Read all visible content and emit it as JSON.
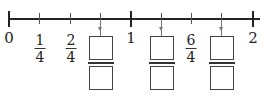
{
  "number_line": {
    "start": 0,
    "end": 2,
    "step": "1/4",
    "whole_labels": [
      "0",
      "1",
      "2"
    ],
    "given_fractions": [
      {
        "position": "1/4",
        "numerator": "1",
        "denominator": "4"
      },
      {
        "position": "2/4",
        "numerator": "2",
        "denominator": "4"
      },
      {
        "position": "6/4",
        "numerator": "6",
        "denominator": "4"
      }
    ],
    "blank_fractions": [
      {
        "position": "3/4",
        "numerator": "",
        "denominator": ""
      },
      {
        "position": "5/4",
        "numerator": "",
        "denominator": ""
      },
      {
        "position": "7/4",
        "numerator": "",
        "denominator": ""
      }
    ]
  }
}
